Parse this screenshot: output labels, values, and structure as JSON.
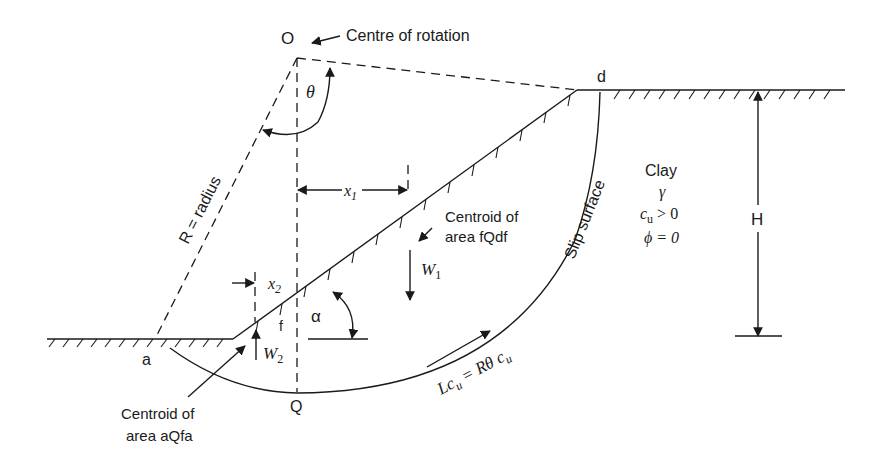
{
  "diagram": {
    "labels": {
      "O": "O",
      "centre_of_rotation": "Centre of rotation",
      "theta": "θ",
      "d": "d",
      "R": "R = radius",
      "x1": "x",
      "x1_sub": "1",
      "x2": "x",
      "x2_sub": "2",
      "centroid_fqdf_1": "Centroid of",
      "centroid_fqdf_2": "area fQdf",
      "W1": "W",
      "W1_sub": "1",
      "W2": "W",
      "W2_sub": "2",
      "f": "f",
      "alpha": "α",
      "a": "a",
      "Q": "Q",
      "centroid_aqfa_1": "Centroid of",
      "centroid_aqfa_2": "area aQfa",
      "slip_surface": "Slip surface",
      "Lcu": "Lc",
      "Lcu_sub": "u",
      "eq": " = Rθ c",
      "eq_sub": "u",
      "clay": "Clay",
      "gamma": "γ",
      "cu": "c",
      "cu_sub": "u",
      "cu_cond": " > 0",
      "phi": "ϕ = 0",
      "H": "H"
    }
  }
}
